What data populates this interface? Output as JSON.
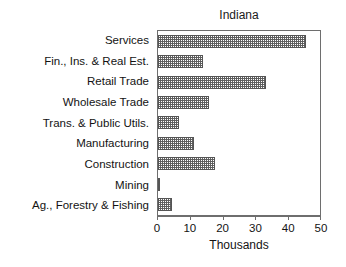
{
  "chart_data": {
    "type": "bar",
    "orientation": "horizontal",
    "title": "Indiana",
    "xlabel": "Thousands",
    "ylabel": "",
    "xlim": [
      0,
      50
    ],
    "xticks": [
      0,
      10,
      20,
      30,
      40,
      50
    ],
    "xtick_labels": [
      "0",
      "10",
      "20",
      "30",
      "40",
      "50"
    ],
    "grid": false,
    "legend": null,
    "categories": [
      "Services",
      "Fin., Ins. & Real Est.",
      "Retail Trade",
      "Wholesale Trade",
      "Trans. & Public Utils.",
      "Manufacturing",
      "Construction",
      "Mining",
      "Ag., Forestry & Fishing"
    ],
    "values": [
      45.0,
      13.8,
      33.0,
      15.5,
      6.3,
      11.0,
      17.5,
      0.6,
      4.2
    ],
    "bar_fill": "#ffffff",
    "bar_pattern": "fine-gray-checker-hatch",
    "bar_edge_color": "#555555",
    "frame_color": "#6e6e6e",
    "text_color": "#131313",
    "background": "#ffffff"
  }
}
